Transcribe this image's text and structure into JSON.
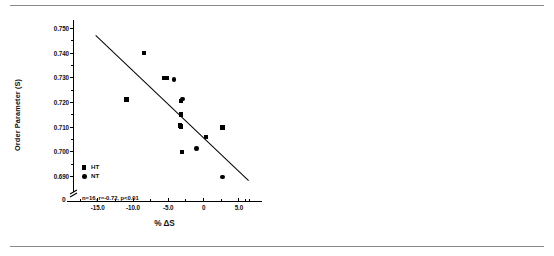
{
  "figure": {
    "background": "#ffffff",
    "rule_color": "#8a8a8a",
    "marker_color": "#000000"
  },
  "chart_data": [
    {
      "type": "scatter",
      "panel": "left",
      "title": "",
      "xlabel": "% ΔS",
      "ylabel": "Order Parameter (S)",
      "xlim": [
        -18.5,
        7.0
      ],
      "ylim": [
        0.6845,
        0.7535
      ],
      "xticks": [
        -15.0,
        -10.0,
        -5.0,
        0,
        5.0
      ],
      "xtick_labels": [
        "-15.0",
        "-10.0",
        "-5.0",
        "0",
        "5.0"
      ],
      "yticks": [
        0.69,
        0.7,
        0.71,
        0.72,
        0.73,
        0.74,
        0.75
      ],
      "ytick_labels": [
        "0.690",
        "0.700",
        "0.710",
        "0.720",
        "0.730",
        "0.740",
        "0.750"
      ],
      "grid": false,
      "axis_break": true,
      "origin_label": "0",
      "annotation": "n=16, r=-0.72, p<0.01",
      "legend_position": "lower-left",
      "legend": [
        {
          "label": "HT",
          "marker": "square"
        },
        {
          "label": "NT",
          "marker": "circle"
        }
      ],
      "series": [
        {
          "name": "HT",
          "marker": "square",
          "points": [
            {
              "x": -8.4,
              "y": 0.74
            },
            {
              "x": -5.6,
              "y": 0.73
            },
            {
              "x": -5.2,
              "y": 0.73
            },
            {
              "x": -10.9,
              "y": 0.7212
            },
            {
              "x": -3.2,
              "y": 0.7207
            },
            {
              "x": -3.2,
              "y": 0.7152
            },
            {
              "x": -3.3,
              "y": 0.7107
            },
            {
              "x": -3.2,
              "y": 0.7103
            },
            {
              "x": 2.7,
              "y": 0.7098
            },
            {
              "x": 0.3,
              "y": 0.706
            },
            {
              "x": -3.1,
              "y": 0.7
            }
          ]
        },
        {
          "name": "NT",
          "marker": "circle",
          "points": [
            {
              "x": -4.2,
              "y": 0.7294
            },
            {
              "x": -3.0,
              "y": 0.7215
            },
            {
              "x": -1.0,
              "y": 0.7013
            },
            {
              "x": 2.7,
              "y": 0.6898
            }
          ]
        }
      ],
      "fit_line": {
        "x1": -15.3,
        "y1": 0.7473,
        "x2": 6.4,
        "y2": 0.6882
      },
      "n": 16,
      "r": -0.72,
      "p": "<0.01"
    },
    {
      "type": "scatter",
      "panel": "right",
      "title": "",
      "xlabel": "% Δh₀/h₋₁",
      "ylabel": "Peak Height Ratio (h₀/h₋₁)",
      "xlim": [
        -14.6,
        -3.6
      ],
      "ylim": [
        5.055,
        5.835
      ],
      "xticks": [
        -14.0,
        -13.0,
        -12.0,
        -11.0,
        -10.0,
        -9.0,
        -8.0,
        -7.0,
        -6.0,
        -5.0,
        -4.0
      ],
      "xtick_labels": [
        "-14.0",
        "-13.0",
        "-12.0",
        "-11.0",
        "-10.0",
        "-9.0",
        "-8.0",
        "-7.0",
        "-6.0",
        "-5.0",
        "-4.0"
      ],
      "yticks": [
        5.1,
        5.2,
        5.3,
        5.4,
        5.5,
        5.6,
        5.7,
        5.8
      ],
      "ytick_labels": [
        "5.10",
        "5.20",
        "5.30",
        "5.40",
        "5.50",
        "5.60",
        "5.70",
        "5.80"
      ],
      "grid": false,
      "axis_break": true,
      "origin_label": "0",
      "annotation": "n=16, r=-0.53, p<0.05",
      "legend_position": "lower-left",
      "legend": [
        {
          "label": "HT",
          "marker": "square"
        },
        {
          "label": "NT",
          "marker": "circle"
        }
      ],
      "series": [
        {
          "name": "HT",
          "marker": "square",
          "points": [
            {
              "x": -13.25,
              "y": 5.722
            },
            {
              "x": -9.1,
              "y": 5.49
            },
            {
              "x": -12.0,
              "y": 5.327
            },
            {
              "x": -8.3,
              "y": 5.291
            },
            {
              "x": -5.95,
              "y": 5.293
            },
            {
              "x": -5.45,
              "y": 5.312
            },
            {
              "x": -10.0,
              "y": 5.211
            },
            {
              "x": -5.9,
              "y": 5.102
            }
          ]
        },
        {
          "name": "NT",
          "marker": "circle",
          "points": [
            {
              "x": -9.45,
              "y": 5.688
            },
            {
              "x": -8.3,
              "y": 5.49
            },
            {
              "x": -6.0,
              "y": 5.487
            },
            {
              "x": -9.1,
              "y": 5.43
            },
            {
              "x": -8.5,
              "y": 5.35
            },
            {
              "x": -5.9,
              "y": 5.257
            },
            {
              "x": -9.6,
              "y": 5.216
            },
            {
              "x": -5.05,
              "y": 5.134
            }
          ]
        }
      ],
      "fit_line": {
        "x1": -14.05,
        "y1": 5.583,
        "x2": -4.15,
        "y2": 5.213
      },
      "n": 16,
      "r": -0.53,
      "p": "<0.05"
    }
  ]
}
